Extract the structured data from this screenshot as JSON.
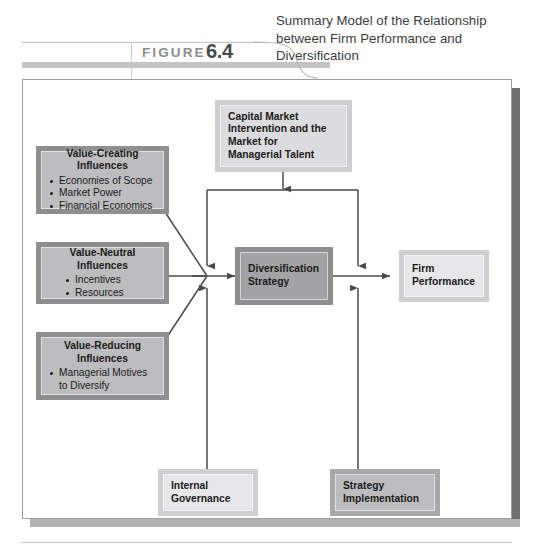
{
  "figure": {
    "label": "FIGURE",
    "number": "6.4",
    "title": "Summary Model of the Relationship between Firm Performance and Diversification"
  },
  "colors": {
    "page_background": "#ffffff",
    "frame_border": "#9d9d9f",
    "frame_shadow_right": "#6f6f71",
    "frame_shadow_bottom": "#b0b0b1",
    "wire": "#4a4a4c",
    "title_text": "#3b3b3d",
    "figure_label": "#8d8d90",
    "figure_number": "#4a4a4c",
    "node_text": "#1a1a1a",
    "box_dark_frame": "#8f8f91",
    "box_mid_frame": "#a9a9ab",
    "box_light_frame": "#cfcfd1",
    "box_dark_fill": "#a3a3a5",
    "box_mid_fill": "#bdbdbf",
    "box_light_fill": "#dcdcde",
    "box_xlight_fill": "#e7e7e9"
  },
  "nodes": {
    "capital_market": {
      "title": "Capital Market Intervention and the Market for Managerial Talent",
      "lines": [
        "Capital Market",
        "Intervention and the",
        "Market for",
        "Managerial Talent"
      ]
    },
    "value_creating": {
      "title": "Value-Creating Influences",
      "title_lines": [
        "Value-Creating",
        "Influences"
      ],
      "bullets": [
        "Economies of Scope",
        "Market Power",
        "Financial Economics"
      ]
    },
    "value_neutral": {
      "title": "Value-Neutral Influences",
      "title_lines": [
        "Value-Neutral",
        "Influences"
      ],
      "bullets": [
        "Incentives",
        "Resources"
      ]
    },
    "value_reducing": {
      "title": "Value-Reducing Influences",
      "title_lines": [
        "Value-Reducing",
        "Influences"
      ],
      "bullets": [
        "Managerial Motives to Diversify"
      ]
    },
    "diversification_strategy": {
      "title": "Diversification Strategy",
      "lines": [
        "Diversification",
        "Strategy"
      ]
    },
    "firm_performance": {
      "title": "Firm Performance",
      "lines": [
        "Firm",
        "Performance"
      ]
    },
    "internal_governance": {
      "title": "Internal Governance",
      "lines": [
        "Internal",
        "Governance"
      ]
    },
    "strategy_implementation": {
      "title": "Strategy Implementation",
      "lines": [
        "Strategy",
        "Implementation"
      ]
    }
  },
  "connections": [
    {
      "from": "value_creating",
      "to": "diversification_strategy",
      "style": "diagonal-merge"
    },
    {
      "from": "value_neutral",
      "to": "diversification_strategy",
      "style": "straight"
    },
    {
      "from": "value_reducing",
      "to": "diversification_strategy",
      "style": "diagonal-merge"
    },
    {
      "from": "capital_market",
      "to": "diversification_strategy",
      "style": "bus-down-arrow"
    },
    {
      "from": "capital_market",
      "to": "firm_performance",
      "style": "bus-down-arrow"
    },
    {
      "from": "diversification_strategy",
      "to": "firm_performance",
      "style": "straight-arrow"
    },
    {
      "from": "internal_governance",
      "to": "diversification_strategy",
      "style": "up-arrow"
    },
    {
      "from": "strategy_implementation",
      "to": "firm_performance",
      "style": "up-arrow"
    }
  ]
}
